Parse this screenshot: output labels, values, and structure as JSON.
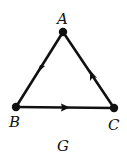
{
  "graph": {
    "name": "G",
    "directed": true,
    "nodes": [
      {
        "id": "A",
        "label": "A",
        "x": 63,
        "y": 32
      },
      {
        "id": "B",
        "label": "B",
        "x": 16,
        "y": 107
      },
      {
        "id": "C",
        "label": "C",
        "x": 114,
        "y": 108
      }
    ],
    "edges": [
      {
        "from": "A",
        "to": "B"
      },
      {
        "from": "B",
        "to": "C"
      },
      {
        "from": "C",
        "to": "A"
      }
    ]
  },
  "labels": {
    "A": "A",
    "B": "B",
    "C": "C",
    "caption": "G"
  },
  "colors": {
    "stroke": "#111111",
    "background": "#ffffff"
  }
}
